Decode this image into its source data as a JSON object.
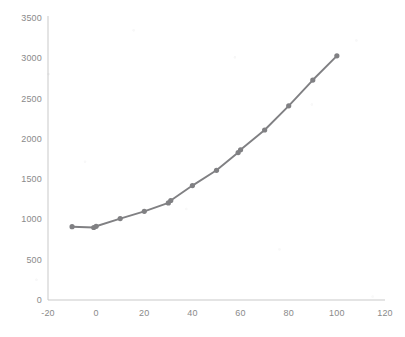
{
  "chart_data": {
    "type": "line",
    "title": "",
    "subtitle": "",
    "xlabel": "",
    "ylabel": "",
    "xlim": [
      -20,
      120
    ],
    "ylim": [
      0,
      3500
    ],
    "grid": false,
    "legend": null,
    "legend_position": "none",
    "series": [
      {
        "name": "series-1",
        "color": "#808083",
        "marker": "circle",
        "x": [
          -10,
          -1,
          0,
          10,
          20,
          30,
          31,
          40,
          50,
          59,
          60,
          70,
          80,
          90,
          100
        ],
        "values": [
          910,
          900,
          915,
          1010,
          1100,
          1205,
          1235,
          1420,
          1610,
          1830,
          1865,
          2110,
          2410,
          2730,
          3030
        ]
      }
    ],
    "x_ticks": [
      -20,
      0,
      20,
      40,
      60,
      80,
      100,
      120
    ],
    "x_tick_labels": [
      "-20",
      "0",
      "20",
      "40",
      "60",
      "80",
      "100",
      "120"
    ],
    "y_ticks": [
      0,
      500,
      1000,
      1500,
      2000,
      2500,
      3000,
      3500
    ],
    "y_tick_labels": [
      "0",
      "500",
      "1000",
      "1500",
      "2000",
      "2500",
      "3000",
      "3500"
    ],
    "axis_color": "#c9c9c9",
    "tick_label_color": "#8a8a8a",
    "background": "#ffffff"
  },
  "plot_geometry": {
    "left": 48,
    "right": 385,
    "top": 18,
    "bottom": 300
  }
}
